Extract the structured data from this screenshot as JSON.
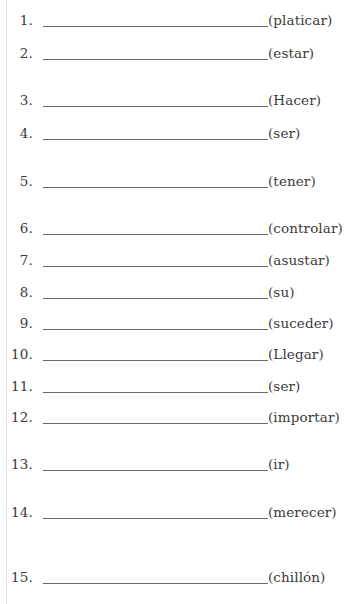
{
  "worksheet": {
    "items": [
      {
        "number": "1.",
        "hint": "(platicar)",
        "answer": "",
        "baseline_y": 24
      },
      {
        "number": "2.",
        "hint": "(estar)",
        "answer": "",
        "baseline_y": 57
      },
      {
        "number": "3.",
        "hint": "(Hacer)",
        "answer": "",
        "baseline_y": 104
      },
      {
        "number": "4.",
        "hint": "(ser)",
        "answer": "",
        "baseline_y": 137
      },
      {
        "number": "5.",
        "hint": "(tener)",
        "answer": "",
        "baseline_y": 185
      },
      {
        "number": "6.",
        "hint": "(controlar)",
        "answer": "",
        "baseline_y": 232
      },
      {
        "number": "7.",
        "hint": "(asustar)",
        "answer": "",
        "baseline_y": 264
      },
      {
        "number": "8.",
        "hint": "(su)",
        "answer": "",
        "baseline_y": 296
      },
      {
        "number": "9.",
        "hint": "(suceder)",
        "answer": "",
        "baseline_y": 327
      },
      {
        "number": "10.",
        "hint": "(Llegar)",
        "answer": "",
        "baseline_y": 358
      },
      {
        "number": "11.",
        "hint": "(ser)",
        "answer": "",
        "baseline_y": 390
      },
      {
        "number": "12.",
        "hint": "(importar)",
        "answer": "",
        "baseline_y": 421
      },
      {
        "number": "13.",
        "hint": "(ir)",
        "answer": "",
        "baseline_y": 468
      },
      {
        "number": "14.",
        "hint": "(merecer)",
        "answer": "",
        "baseline_y": 516
      },
      {
        "number": "15.",
        "hint": "(chillón)",
        "answer": "",
        "baseline_y": 581
      }
    ]
  },
  "colors": {
    "text": "#3a3a3a",
    "underline": "#6a6a6a",
    "margin_rule": "#e4e4e4",
    "background": "#ffffff"
  }
}
